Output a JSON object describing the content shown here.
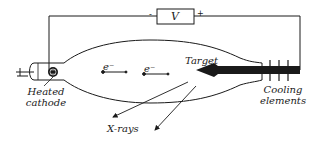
{
  "diagram": {
    "colors": {
      "stroke": "#1a1a1a",
      "background": "#ffffff"
    },
    "power_supply": {
      "label": "V",
      "negative_sign": "-",
      "positive_sign": "+"
    },
    "electrons": [
      {
        "label": "e⁻"
      },
      {
        "label": "e⁻"
      }
    ],
    "labels": {
      "target": "Target",
      "cathode_line1": "Heated",
      "cathode_line2": "cathode",
      "cooling_line1": "Cooling",
      "cooling_line2": "elements",
      "xrays": "X-rays"
    }
  }
}
